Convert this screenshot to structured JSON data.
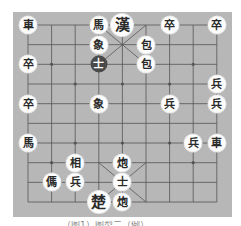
{
  "board": {
    "type": "xiangqi",
    "columns": 9,
    "rows": 10,
    "origin": {
      "x": 28,
      "y": 25
    },
    "spacing": {
      "x": 23.6,
      "y": 19.67
    },
    "colors": {
      "board": "#b7b7b7",
      "line": "#555555",
      "piece": "#fdfdfd",
      "piece_text": "#2a2a2a",
      "dark_piece": "#4a4a4a"
    },
    "markers": [
      {
        "col": 1,
        "row": 2
      },
      {
        "col": 7,
        "row": 2
      },
      {
        "col": 2,
        "row": 3
      },
      {
        "col": 4,
        "row": 3
      },
      {
        "col": 6,
        "row": 3
      },
      {
        "col": 2,
        "row": 6
      },
      {
        "col": 4,
        "row": 6
      },
      {
        "col": 6,
        "row": 6
      },
      {
        "col": 1,
        "row": 7
      },
      {
        "col": 7,
        "row": 7
      }
    ]
  },
  "pieces": [
    {
      "char": "車",
      "col": 0,
      "row": 0,
      "style": "normal"
    },
    {
      "char": "馬",
      "col": 3,
      "row": 0,
      "style": "normal"
    },
    {
      "char": "漢",
      "col": 4,
      "row": 0,
      "style": "general"
    },
    {
      "char": "卒",
      "col": 6,
      "row": 0,
      "style": "normal"
    },
    {
      "char": "卒",
      "col": 8,
      "row": 0,
      "style": "normal"
    },
    {
      "char": "象",
      "col": 3,
      "row": 1,
      "style": "normal"
    },
    {
      "char": "包",
      "col": 5,
      "row": 1,
      "style": "normal"
    },
    {
      "char": "卒",
      "col": 0,
      "row": 2,
      "style": "normal"
    },
    {
      "char": "士",
      "col": 3,
      "row": 2,
      "style": "dark"
    },
    {
      "char": "包",
      "col": 5,
      "row": 2,
      "style": "normal"
    },
    {
      "char": "兵",
      "col": 8,
      "row": 3,
      "style": "normal"
    },
    {
      "char": "卒",
      "col": 0,
      "row": 4,
      "style": "normal"
    },
    {
      "char": "象",
      "col": 3,
      "row": 4,
      "style": "normal"
    },
    {
      "char": "兵",
      "col": 6,
      "row": 4,
      "style": "normal"
    },
    {
      "char": "兵",
      "col": 8,
      "row": 4,
      "style": "normal"
    },
    {
      "char": "馬",
      "col": 0,
      "row": 6,
      "style": "normal"
    },
    {
      "char": "兵",
      "col": 7,
      "row": 6,
      "style": "normal"
    },
    {
      "char": "車",
      "col": 8,
      "row": 6,
      "style": "normal"
    },
    {
      "char": "相",
      "col": 2,
      "row": 7,
      "style": "normal"
    },
    {
      "char": "炮",
      "col": 4,
      "row": 7,
      "style": "normal"
    },
    {
      "char": "傌",
      "col": 1,
      "row": 8,
      "style": "normal"
    },
    {
      "char": "兵",
      "col": 2,
      "row": 8,
      "style": "normal"
    },
    {
      "char": "士",
      "col": 4,
      "row": 8,
      "style": "normal"
    },
    {
      "char": "楚",
      "col": 3,
      "row": 9,
      "style": "general"
    },
    {
      "char": "炮",
      "col": 4,
      "row": 9,
      "style": "normal"
    }
  ],
  "caption": {
    "text": "（图1）图型二（例）"
  }
}
